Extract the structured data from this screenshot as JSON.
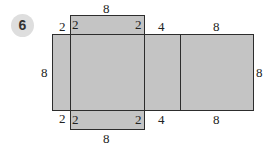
{
  "problem": {
    "number": "6"
  },
  "net": {
    "description": "Net of a rectangular prism 8 x 8 x 2 / 4",
    "fill_color": "#c4c4c4",
    "stroke_color": "#2d2d2d",
    "faces": [
      {
        "name": "top-flap",
        "w": 8,
        "h": 2
      },
      {
        "name": "left-flap",
        "w": 2,
        "h": 8
      },
      {
        "name": "center-square",
        "w": 8,
        "h": 8
      },
      {
        "name": "middle-strip",
        "w": 4,
        "h": 8
      },
      {
        "name": "right-square",
        "w": 8,
        "h": 8
      },
      {
        "name": "bottom-flap",
        "w": 8,
        "h": 2
      }
    ],
    "labels": {
      "top_flap_width": "8",
      "top_flap_left_height": "2",
      "top_flap_right_height": "2",
      "left_flap_top_width": "2",
      "left_flap_height": "8",
      "left_flap_bottom_width": "2",
      "bottom_flap_left_height": "2",
      "bottom_flap_right_height": "2",
      "bottom_flap_width": "8",
      "middle_strip_top_width": "4",
      "middle_strip_bottom_width": "4",
      "right_square_top_width": "8",
      "right_square_bottom_width": "8",
      "right_square_height": "8"
    }
  }
}
